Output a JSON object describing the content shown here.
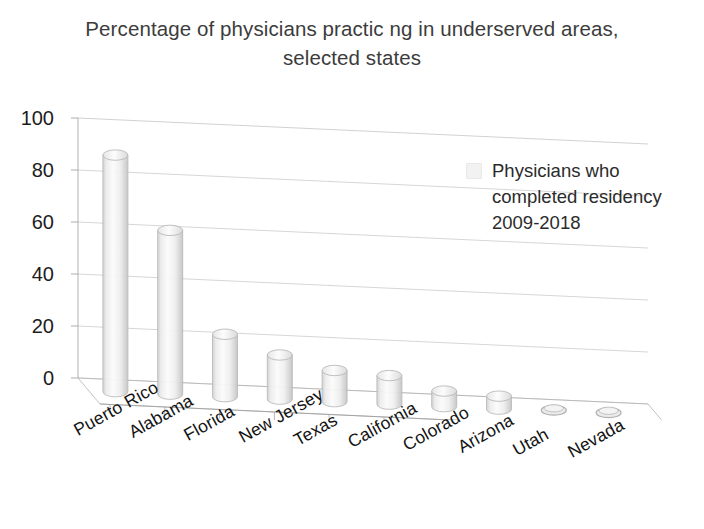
{
  "chart_data": {
    "type": "bar",
    "title": "Percentage of physicians practic ng in underserved areas, selected states",
    "title_line1": "Percentage of physicians practic ng in underserved areas,",
    "title_line2": "selected states",
    "xlabel": "",
    "ylabel": "",
    "categories": [
      "Puerto Rico",
      "Alabama",
      "Florida",
      "New Jersey",
      "Texas",
      "California",
      "Colorado",
      "Arizona",
      "Utah",
      "Nevada"
    ],
    "values": [
      91,
      63,
      24,
      17,
      12,
      11,
      6,
      5,
      1,
      1
    ],
    "series": [
      {
        "name": "Physicians who completed residency 2009-2018",
        "values": [
          91,
          63,
          24,
          17,
          12,
          11,
          6,
          5,
          1,
          1
        ]
      }
    ],
    "ylim": [
      0,
      100
    ],
    "y_ticks": [
      0,
      20,
      40,
      60,
      80,
      100
    ],
    "y_tick_labels": [
      "0",
      "20",
      "40",
      "60",
      "80",
      "100"
    ],
    "grid": true,
    "grid_axis": "y",
    "legend_position": "inside-top-right",
    "chart_style": "3d-cylinder",
    "bar_color": "#f2f2f2",
    "bar_edge_color": "#b9b9b9",
    "grid_color": "#b5b5b5",
    "axis_color": "#9a9a9a",
    "text_color": "#2b2b2b"
  },
  "legend": {
    "swatch_name": "legend-color-swatch",
    "label_line1": "Physicians who",
    "label_line2": "completed residency",
    "label_line3": "2009-2018",
    "label_full": "Physicians who completed residency 2009-2018"
  }
}
